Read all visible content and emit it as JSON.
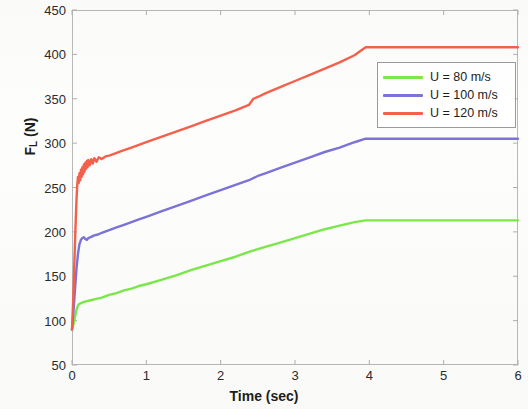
{
  "chart_data": {
    "type": "line",
    "title": "",
    "xlabel": "Time (sec)",
    "ylabel": "F_L (N)",
    "ylabel_base": "F",
    "ylabel_sub": "L",
    "ylabel_unit": "(N)",
    "xlim": [
      0,
      6
    ],
    "ylim": [
      50,
      450
    ],
    "xticks": [
      0,
      1,
      2,
      3,
      4,
      5,
      6
    ],
    "yticks": [
      50,
      100,
      150,
      200,
      250,
      300,
      350,
      400,
      450
    ],
    "xtick_labels": [
      "0",
      "1",
      "2",
      "3",
      "4",
      "5",
      "6"
    ],
    "ytick_labels": [
      "50",
      "100",
      "150",
      "200",
      "250",
      "300",
      "350",
      "400",
      "450"
    ],
    "grid": false,
    "legend_position": "upper right inside",
    "series": [
      {
        "name": "U = 80 m/s",
        "color": "#7CE84A",
        "plateau_value": 213,
        "plateau_start_time": 4.0,
        "initial_value": 90,
        "points": [
          [
            0.0,
            90
          ],
          [
            0.02,
            96
          ],
          [
            0.04,
            104
          ],
          [
            0.06,
            112
          ],
          [
            0.08,
            117
          ],
          [
            0.1,
            119
          ],
          [
            0.13,
            120
          ],
          [
            0.16,
            121
          ],
          [
            0.2,
            122
          ],
          [
            0.25,
            123
          ],
          [
            0.3,
            124
          ],
          [
            0.4,
            126
          ],
          [
            0.5,
            129
          ],
          [
            0.6,
            131
          ],
          [
            0.7,
            134
          ],
          [
            0.8,
            136
          ],
          [
            0.9,
            139
          ],
          [
            1.0,
            141
          ],
          [
            1.2,
            146
          ],
          [
            1.4,
            151
          ],
          [
            1.6,
            157
          ],
          [
            1.8,
            162
          ],
          [
            2.0,
            167
          ],
          [
            2.2,
            172
          ],
          [
            2.4,
            178
          ],
          [
            2.6,
            183
          ],
          [
            2.8,
            188
          ],
          [
            3.0,
            193
          ],
          [
            3.2,
            198
          ],
          [
            3.4,
            203
          ],
          [
            3.6,
            207
          ],
          [
            3.8,
            211
          ],
          [
            3.95,
            213
          ],
          [
            4.05,
            213
          ],
          [
            4.5,
            213
          ],
          [
            5.0,
            213
          ],
          [
            5.5,
            213
          ],
          [
            6.0,
            213
          ]
        ]
      },
      {
        "name": "U = 100 m/s",
        "color": "#7B73D8",
        "plateau_value": 305,
        "plateau_start_time": 4.0,
        "initial_value": 90,
        "points": [
          [
            0.0,
            90
          ],
          [
            0.02,
            110
          ],
          [
            0.04,
            135
          ],
          [
            0.06,
            158
          ],
          [
            0.08,
            175
          ],
          [
            0.1,
            186
          ],
          [
            0.12,
            191
          ],
          [
            0.14,
            193
          ],
          [
            0.16,
            194
          ],
          [
            0.18,
            192
          ],
          [
            0.2,
            191
          ],
          [
            0.22,
            193
          ],
          [
            0.25,
            194
          ],
          [
            0.3,
            196
          ],
          [
            0.35,
            197
          ],
          [
            0.4,
            199
          ],
          [
            0.5,
            202
          ],
          [
            0.6,
            205
          ],
          [
            0.7,
            208
          ],
          [
            0.8,
            211
          ],
          [
            0.9,
            214
          ],
          [
            1.0,
            217
          ],
          [
            1.2,
            223
          ],
          [
            1.4,
            229
          ],
          [
            1.6,
            235
          ],
          [
            1.8,
            241
          ],
          [
            2.0,
            247
          ],
          [
            2.2,
            253
          ],
          [
            2.4,
            259
          ],
          [
            2.5,
            263
          ],
          [
            2.6,
            266
          ],
          [
            2.8,
            272
          ],
          [
            3.0,
            278
          ],
          [
            3.2,
            284
          ],
          [
            3.4,
            290
          ],
          [
            3.6,
            295
          ],
          [
            3.8,
            301
          ],
          [
            3.95,
            305
          ],
          [
            4.05,
            305
          ],
          [
            4.5,
            305
          ],
          [
            5.0,
            305
          ],
          [
            5.5,
            305
          ],
          [
            6.0,
            305
          ]
        ]
      },
      {
        "name": "U = 120 m/s",
        "color": "#F4604C",
        "plateau_value": 408,
        "plateau_start_time": 4.0,
        "initial_value": 90,
        "points": [
          [
            0.0,
            90
          ],
          [
            0.015,
            120
          ],
          [
            0.03,
            160
          ],
          [
            0.045,
            200
          ],
          [
            0.06,
            235
          ],
          [
            0.07,
            252
          ],
          [
            0.08,
            262
          ],
          [
            0.09,
            255
          ],
          [
            0.1,
            266
          ],
          [
            0.11,
            258
          ],
          [
            0.12,
            270
          ],
          [
            0.13,
            262
          ],
          [
            0.14,
            273
          ],
          [
            0.15,
            265
          ],
          [
            0.16,
            276
          ],
          [
            0.17,
            268
          ],
          [
            0.18,
            278
          ],
          [
            0.19,
            271
          ],
          [
            0.2,
            280
          ],
          [
            0.21,
            273
          ],
          [
            0.22,
            281
          ],
          [
            0.24,
            275
          ],
          [
            0.26,
            282
          ],
          [
            0.28,
            277
          ],
          [
            0.3,
            283
          ],
          [
            0.33,
            279
          ],
          [
            0.36,
            284
          ],
          [
            0.4,
            282
          ],
          [
            0.45,
            285
          ],
          [
            0.5,
            286
          ],
          [
            0.6,
            289
          ],
          [
            0.7,
            292
          ],
          [
            0.8,
            295
          ],
          [
            0.9,
            298
          ],
          [
            1.0,
            301
          ],
          [
            1.2,
            307
          ],
          [
            1.4,
            313
          ],
          [
            1.6,
            319
          ],
          [
            1.8,
            325
          ],
          [
            2.0,
            331
          ],
          [
            2.2,
            337
          ],
          [
            2.38,
            343
          ],
          [
            2.44,
            350
          ],
          [
            2.5,
            352
          ],
          [
            2.6,
            356
          ],
          [
            2.8,
            363
          ],
          [
            3.0,
            370
          ],
          [
            3.2,
            377
          ],
          [
            3.4,
            384
          ],
          [
            3.6,
            391
          ],
          [
            3.8,
            399
          ],
          [
            3.95,
            408
          ],
          [
            4.05,
            408
          ],
          [
            4.5,
            408
          ],
          [
            5.0,
            408
          ],
          [
            5.5,
            408
          ],
          [
            6.0,
            408
          ]
        ]
      }
    ]
  },
  "legend": {
    "items": [
      {
        "label": "U = 80 m/s",
        "color": "#7CE84A"
      },
      {
        "label": "U = 100 m/s",
        "color": "#7B73D8"
      },
      {
        "label": "U = 120 m/s",
        "color": "#F4604C"
      }
    ]
  }
}
